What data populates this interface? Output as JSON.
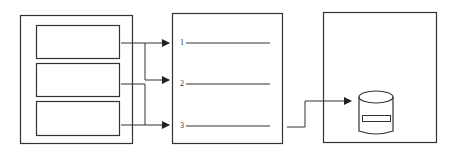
{
  "diagram": {
    "left_panel": {
      "slots": [
        {
          "id": "slot-1",
          "label": ""
        },
        {
          "id": "slot-2",
          "label": ""
        },
        {
          "id": "slot-3",
          "label": ""
        }
      ]
    },
    "middle_panel": {
      "lines": [
        {
          "number": "1"
        },
        {
          "number": "2"
        },
        {
          "number": "3"
        }
      ]
    },
    "right_panel": {
      "icon": "database-cylinder-icon"
    },
    "colors": {
      "stroke": "#333333",
      "background": "#ffffff"
    }
  }
}
